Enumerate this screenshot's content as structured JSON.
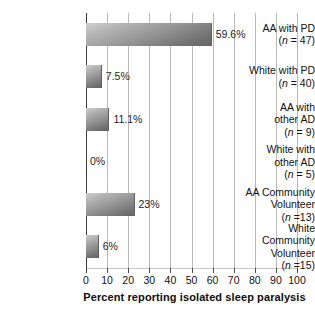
{
  "chart_data": {
    "type": "bar",
    "orientation": "horizontal",
    "title": "",
    "subtitle": "",
    "xlabel": "Percent reporting isolated sleep paralysis",
    "ylabel": "",
    "xlim": [
      0,
      100
    ],
    "xticks": [
      0,
      10,
      20,
      30,
      40,
      50,
      60,
      70,
      80,
      90,
      100
    ],
    "xtick_labels": [
      "0",
      "10",
      "20",
      "30",
      "40",
      "50",
      "60",
      "70",
      "80",
      "90",
      "100"
    ],
    "grid": "vertical",
    "legend": "none",
    "categories": [
      "AA with PD (n = 47)",
      "White with PD (n = 40)",
      "AA with other AD (n = 9)",
      "White with other AD (n = 5)",
      "AA Community Volunteer (n =13)",
      "White Community Volunteer (n =15)"
    ],
    "values": [
      59.6,
      7.5,
      11.1,
      0,
      23,
      6
    ],
    "value_labels": [
      "59.6%",
      "7.5%",
      "11.1%",
      "0%",
      "23%",
      "6%"
    ],
    "bars": [
      {
        "label_lines": [
          [
            {
              "text": "AA with PD",
              "italic": false
            }
          ],
          [
            {
              "text": "(",
              "italic": false
            },
            {
              "text": "n",
              "italic": true
            },
            {
              "text": " = 47)",
              "italic": false
            }
          ]
        ],
        "value": 59.6,
        "value_label": "59.6%"
      },
      {
        "label_lines": [
          [
            {
              "text": "White with PD",
              "italic": false
            }
          ],
          [
            {
              "text": "(",
              "italic": false
            },
            {
              "text": "n",
              "italic": true
            },
            {
              "text": " = 40)",
              "italic": false
            }
          ]
        ],
        "value": 7.5,
        "value_label": "7.5%"
      },
      {
        "label_lines": [
          [
            {
              "text": "AA with",
              "italic": false
            }
          ],
          [
            {
              "text": "other AD",
              "italic": false
            }
          ],
          [
            {
              "text": "(",
              "italic": false
            },
            {
              "text": "n",
              "italic": true
            },
            {
              "text": " = 9)",
              "italic": false
            }
          ]
        ],
        "value": 11.1,
        "value_label": "11.1%"
      },
      {
        "label_lines": [
          [
            {
              "text": "White with",
              "italic": false
            }
          ],
          [
            {
              "text": "other AD",
              "italic": false
            }
          ],
          [
            {
              "text": "(",
              "italic": false
            },
            {
              "text": "n",
              "italic": true
            },
            {
              "text": " = 5)",
              "italic": false
            }
          ]
        ],
        "value": 0,
        "value_label": "0%"
      },
      {
        "label_lines": [
          [
            {
              "text": "AA Community",
              "italic": false
            }
          ],
          [
            {
              "text": "Volunteer",
              "italic": false
            }
          ],
          [
            {
              "text": "(",
              "italic": false
            },
            {
              "text": "n",
              "italic": true
            },
            {
              "text": " =13)",
              "italic": false
            }
          ]
        ],
        "value": 23,
        "value_label": "23%"
      },
      {
        "label_lines": [
          [
            {
              "text": "White",
              "italic": false
            }
          ],
          [
            {
              "text": "Community",
              "italic": false
            }
          ],
          [
            {
              "text": "Volunteer",
              "italic": false
            }
          ],
          [
            {
              "text": "(",
              "italic": false
            },
            {
              "text": "n",
              "italic": true
            },
            {
              "text": " =15)",
              "italic": false
            }
          ]
        ],
        "value": 6,
        "value_label": "6%"
      }
    ],
    "colors": {
      "bar_light": "#cfcfcf",
      "bar_dark": "#666666",
      "gridline": "#b9b9b9",
      "axis": "#3a3a3a",
      "text": "#111111",
      "background": "#ffffff"
    }
  }
}
